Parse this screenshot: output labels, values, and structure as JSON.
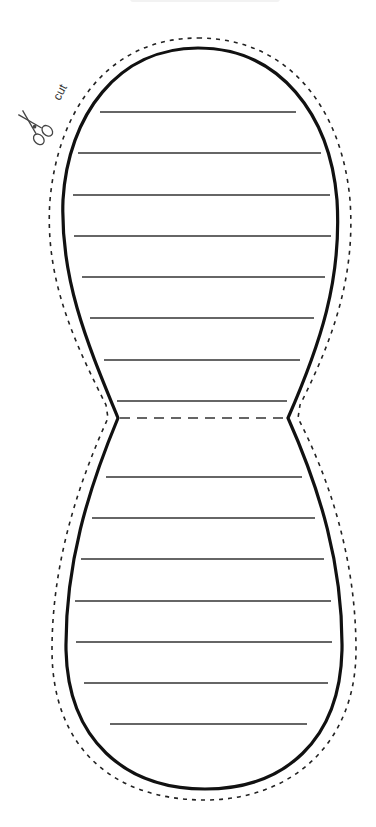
{
  "template": {
    "type": "peanut-shaped lined writing template (printable cut-out)",
    "cut_label": "cut",
    "icons": [
      "scissors-icon"
    ],
    "colors": {
      "background": "#ffffff",
      "outline": "#111111",
      "cut_line": "#222222",
      "ruled_line": "#333333"
    },
    "upper_section": {
      "ruled_line_count": 8
    },
    "fold_line": {
      "style": "dashed",
      "y": 418
    },
    "lower_section": {
      "ruled_line_count": 7
    }
  }
}
